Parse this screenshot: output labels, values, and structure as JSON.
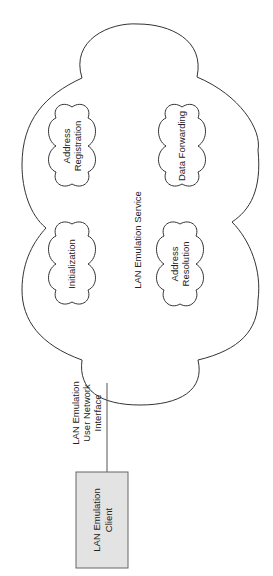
{
  "diagram": {
    "service": {
      "label": "LAN Emulation Service"
    },
    "functions": [
      {
        "id": "address-registration",
        "lines": [
          "Address",
          "Registration"
        ]
      },
      {
        "id": "data-forwarding",
        "lines": [
          "Data Forwarding"
        ]
      },
      {
        "id": "initialization",
        "lines": [
          "Initialization"
        ]
      },
      {
        "id": "address-resolution",
        "lines": [
          "Address",
          "Resolution"
        ]
      }
    ],
    "interface": {
      "lines": [
        "LAN Emulation",
        "User Network",
        "Interface"
      ]
    },
    "client": {
      "lines": [
        "LAN Emulation",
        "Client"
      ]
    },
    "colors": {
      "stroke": "#333333",
      "client_fill": "#e3e3e3"
    }
  }
}
